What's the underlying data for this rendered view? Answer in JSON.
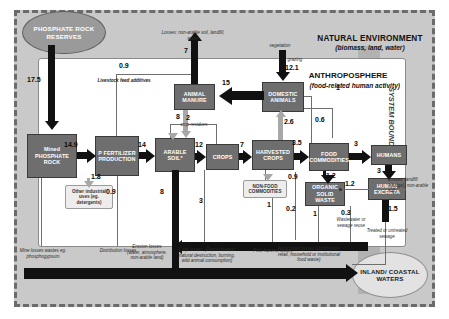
{
  "diagram": {
    "title_natural": "NATURAL ENVIRONMENT",
    "subtitle_natural": "(biomass, land, water)",
    "title_anthro": "ANTHROPOSPHERE",
    "subtitle_anthro": "(food-related human activity)",
    "system_boundary": "SYSTEM BOUNDARY"
  },
  "nodes": {
    "rock_reserves": "PHOSPHATE ROCK RESERVES",
    "mined_rock": "Mined PHOSPHATE ROCK",
    "p_fertilizer": "P FERTILIZER PRODUCTION",
    "arable_soil": "ARABLE SOIL*",
    "crops": "CROPS",
    "harvested_crops": "HARVESTED CROPS",
    "food_commodities": "FOOD COMMODITIES",
    "humans": "HUMANS",
    "human_excreta": "HUMAN EXCRETA",
    "organic_solid_waste": "ORGANIC SOLID WASTE",
    "animal_manure": "ANIMAL MANURE",
    "domestic_animals": "DOMESTIC ANIMALS",
    "non_food_commodities": "NON-FOOD COMMODITIES",
    "other_industrial": "Other industrial uses (eg. detergents)",
    "inland_coastal_waters": "INLAND/ COASTAL WATERS"
  },
  "flows": {
    "reserves_to_mined": "17.5",
    "mined_to_fert": "14.9",
    "mined_other_ind": "1.8",
    "fert_to_arable": "14",
    "arable_to_crops": "12",
    "crops_to_harvested": "7",
    "crop_residues": "2",
    "harvested_to_food": "3.5",
    "harvested_to_animals": "2.6",
    "harvested_to_nonfood": "0.9",
    "food_to_humans": "3",
    "food_to_osw": "1.2",
    "humans_to_excreta": "3",
    "excreta_losses": "1.2",
    "excreta_to_waters": "1.5",
    "osw_to_arable": "0.2",
    "osw_out": "1",
    "wastewater_reuse": "0.3",
    "animals_to_manure": "15",
    "manure_to_arable": "8",
    "manure_losses": "7",
    "livestock_feed_additives": "0.9",
    "grazing": "12.1",
    "erosion_from_arable": "8",
    "crop_losses": "3",
    "distribution_losses": "0.9",
    "postharvest_losses": "1",
    "animals_extra": "1",
    "food_chain_losses": "1",
    "domestic_to_food": "0.6"
  },
  "captions": {
    "losses_nonarable": "Losses: non-arable soil, landfill, water",
    "vegetation": "vegetation",
    "grazing_label": "grazing",
    "livestock_feed": "Livestock feed additives",
    "crop_residues_label": "crop residues",
    "mine_losses": "Mine losses wastes eg. phosphogypsum",
    "distribution_losses_label": "Distribution losses",
    "erosion_losses": "Erosion losses (water, atmosphere, non-arable land)",
    "crop_losses_label": "Crop losses: (Pests/disease/ natural destruction, burning, wild animal consumption)",
    "postharvest_label": "Post-harvest losses",
    "foodchain_label": "Food chain losses (distribution, retail, household or institutional food waste)",
    "wastewater_label": "Wastewater or sewage reuse",
    "sewage_label": "Treated or untreated sewage",
    "excreta_losses_label": "Losses: landfill (sludge), non-arable soil"
  }
}
